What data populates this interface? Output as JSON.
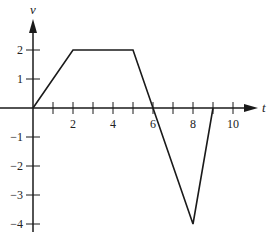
{
  "chart_data": {
    "type": "line",
    "title": "",
    "xlabel": "t",
    "ylabel": "v",
    "xlim": [
      0,
      11
    ],
    "ylim": [
      -4.5,
      2.8
    ],
    "grid": false,
    "legend": null,
    "x_ticks": [
      1,
      2,
      3,
      4,
      5,
      6,
      7,
      8,
      9,
      10
    ],
    "x_tick_labels": [
      {
        "value": 2,
        "label": "2"
      },
      {
        "value": 4,
        "label": "4"
      },
      {
        "value": 6,
        "label": "6"
      },
      {
        "value": 8,
        "label": "8"
      },
      {
        "value": 10,
        "label": "10"
      }
    ],
    "y_ticks": [
      {
        "value": 2,
        "label": "2"
      },
      {
        "value": 1,
        "label": "1"
      },
      {
        "value": -1,
        "label": "−1"
      },
      {
        "value": -2,
        "label": "−2"
      },
      {
        "value": -3,
        "label": "−3"
      },
      {
        "value": -4,
        "label": "−4"
      }
    ],
    "series": [
      {
        "name": "v(t)",
        "x": [
          0,
          2,
          5,
          6,
          8,
          9
        ],
        "y": [
          0,
          2,
          2,
          0,
          -4,
          0
        ]
      }
    ],
    "colors": {
      "line": "#1a1a1a",
      "axis": "#1a1a1a"
    }
  }
}
